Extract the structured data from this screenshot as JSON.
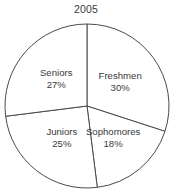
{
  "chart_data": {
    "type": "pie",
    "title": "2005",
    "xlabel": "",
    "ylabel": "",
    "legend_position": "none",
    "grid": false,
    "labels_inside_slices": true,
    "start_angle_deg": 0,
    "direction": "clockwise",
    "categories": [
      "Freshmen",
      "Sophomores",
      "Juniors",
      "Seniors"
    ],
    "values": [
      30,
      18,
      25,
      27
    ],
    "value_unit": "%",
    "slices": [
      {
        "name": "Freshmen",
        "value": 30,
        "label": "Freshmen",
        "percent_text": "30%",
        "start_deg": 0,
        "end_deg": 108,
        "fill": "#ffffff",
        "stroke": "#4a4a4a"
      },
      {
        "name": "Sophomores",
        "value": 18,
        "label": "Sophomores",
        "percent_text": "18%",
        "start_deg": 108,
        "end_deg": 172.8,
        "fill": "#ffffff",
        "stroke": "#4a4a4a"
      },
      {
        "name": "Juniors",
        "value": 25,
        "label": "Juniors",
        "percent_text": "25%",
        "start_deg": 172.8,
        "end_deg": 262.8,
        "fill": "#ffffff",
        "stroke": "#4a4a4a"
      },
      {
        "name": "Seniors",
        "value": 27,
        "label": "Seniors",
        "percent_text": "27%",
        "start_deg": 262.8,
        "end_deg": 360,
        "fill": "#ffffff",
        "stroke": "#4a4a4a"
      }
    ],
    "geometry": {
      "center_x": 87,
      "center_y": 106,
      "radius": 82
    },
    "colors": {
      "background": "#ffffff",
      "outline": "#4a4a4a",
      "text": "#3a3a3a"
    }
  }
}
